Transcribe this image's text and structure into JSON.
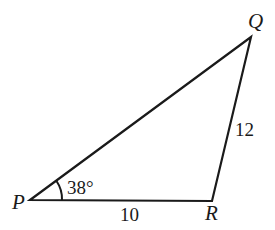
{
  "diagram": {
    "type": "triangle",
    "vertices": [
      {
        "name": "P",
        "x": 30,
        "y": 200
      },
      {
        "name": "Q",
        "x": 251,
        "y": 37
      },
      {
        "name": "R",
        "x": 212,
        "y": 201
      }
    ],
    "side_labels": {
      "PR": "10",
      "RQ": "12"
    },
    "angle_label": "38°",
    "angle_vertex": "P",
    "stroke_color": "#1a1a1a"
  }
}
